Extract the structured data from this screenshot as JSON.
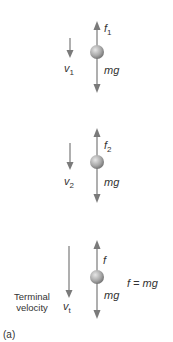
{
  "figure": {
    "panel_label": "(a)",
    "colors": {
      "arrow": "#7a7a7a",
      "ball_light": "#d9d9d9",
      "ball_dark": "#7d7d7d",
      "text": "#333333"
    },
    "stages": [
      {
        "velocity_label": "v",
        "velocity_sub": "1",
        "drag_label": "f",
        "drag_sub": "1",
        "weight_label": "mg"
      },
      {
        "velocity_label": "v",
        "velocity_sub": "2",
        "drag_label": "f",
        "drag_sub": "2",
        "weight_label": "mg"
      },
      {
        "velocity_label": "v",
        "velocity_sub": "t",
        "drag_label": "f",
        "drag_sub": "",
        "weight_label": "mg",
        "caption_line1": "Terminal",
        "caption_line2": "velocity",
        "equation": "f = mg"
      }
    ]
  }
}
